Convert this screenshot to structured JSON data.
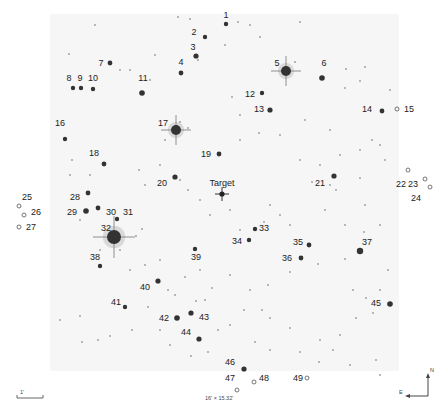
{
  "field_size_label": "16' × 15.32'",
  "scale_bar_label": "1'",
  "compass": {
    "north": "N",
    "east": "E"
  },
  "target": {
    "label": "Target",
    "x": 222,
    "y": 194
  },
  "colors": {
    "background": "#ffffff",
    "field": "#f6f6f6",
    "star": "#222222",
    "label": "#222222"
  },
  "comparison_stars": [
    {
      "id": "1",
      "x": 226,
      "y": 24,
      "lx": 226,
      "ly": 18,
      "r": 2.2,
      "off": false
    },
    {
      "id": "2",
      "x": 205,
      "y": 37,
      "lx": 194,
      "ly": 35,
      "r": 2.2,
      "off": false
    },
    {
      "id": "3",
      "x": 196,
      "y": 56,
      "lx": 193,
      "ly": 50,
      "r": 2.6,
      "off": false
    },
    {
      "id": "4",
      "x": 181,
      "y": 73,
      "lx": 181,
      "ly": 65,
      "r": 2.4,
      "off": false
    },
    {
      "id": "5",
      "x": 286,
      "y": 71,
      "lx": 277,
      "ly": 66,
      "r": 5,
      "off": false
    },
    {
      "id": "6",
      "x": 322,
      "y": 78,
      "lx": 324,
      "ly": 66,
      "r": 2.8,
      "off": false
    },
    {
      "id": "7",
      "x": 110,
      "y": 63,
      "lx": 101,
      "ly": 66,
      "r": 2.4,
      "off": false
    },
    {
      "id": "8",
      "x": 73,
      "y": 88,
      "lx": 69,
      "ly": 81,
      "r": 2.2,
      "off": false
    },
    {
      "id": "9",
      "x": 81,
      "y": 88,
      "lx": 80,
      "ly": 81,
      "r": 2.2,
      "off": false
    },
    {
      "id": "10",
      "x": 93,
      "y": 89,
      "lx": 93,
      "ly": 81,
      "r": 2.2,
      "off": false
    },
    {
      "id": "11",
      "x": 142,
      "y": 93,
      "lx": 143,
      "ly": 81,
      "r": 2.8,
      "off": false
    },
    {
      "id": "12",
      "x": 262,
      "y": 93,
      "lx": 250,
      "ly": 97,
      "r": 2.2,
      "off": false
    },
    {
      "id": "13",
      "x": 270,
      "y": 110,
      "lx": 259,
      "ly": 112,
      "r": 2.6,
      "off": false
    },
    {
      "id": "14",
      "x": 382,
      "y": 111,
      "lx": 367,
      "ly": 112,
      "r": 2.4,
      "off": false
    },
    {
      "id": "15",
      "x": 397,
      "y": 109,
      "lx": 409,
      "ly": 112,
      "r": 2,
      "off": true
    },
    {
      "id": "16",
      "x": 65,
      "y": 139,
      "lx": 60,
      "ly": 126,
      "r": 2.2,
      "off": false
    },
    {
      "id": "17",
      "x": 176,
      "y": 130,
      "lx": 163,
      "ly": 126,
      "r": 5,
      "off": false
    },
    {
      "id": "18",
      "x": 104,
      "y": 164,
      "lx": 94,
      "ly": 156,
      "r": 2.4,
      "off": false
    },
    {
      "id": "19",
      "x": 219,
      "y": 154,
      "lx": 206,
      "ly": 157,
      "r": 2.4,
      "off": false
    },
    {
      "id": "20",
      "x": 175,
      "y": 177,
      "lx": 162,
      "ly": 186,
      "r": 2.6,
      "off": false
    },
    {
      "id": "21",
      "x": 334,
      "y": 176,
      "lx": 320,
      "ly": 186,
      "r": 2.6,
      "off": false
    },
    {
      "id": "22",
      "x": 408,
      "y": 170,
      "lx": 401,
      "ly": 187,
      "r": 2,
      "off": true
    },
    {
      "id": "23",
      "x": 425,
      "y": 179,
      "lx": 413,
      "ly": 187,
      "r": 2,
      "off": true
    },
    {
      "id": "24",
      "x": 430,
      "y": 187,
      "lx": 416,
      "ly": 201,
      "r": 2,
      "off": true
    },
    {
      "id": "25",
      "x": 19,
      "y": 206,
      "lx": 27,
      "ly": 200,
      "r": 2,
      "off": true
    },
    {
      "id": "26",
      "x": 24,
      "y": 215,
      "lx": 36,
      "ly": 215,
      "r": 2,
      "off": true
    },
    {
      "id": "27",
      "x": 19,
      "y": 227,
      "lx": 31,
      "ly": 230,
      "r": 2,
      "off": true
    },
    {
      "id": "28",
      "x": 88,
      "y": 193,
      "lx": 75,
      "ly": 200,
      "r": 2.4,
      "off": false
    },
    {
      "id": "29",
      "x": 86,
      "y": 211,
      "lx": 72,
      "ly": 215,
      "r": 2.8,
      "off": false
    },
    {
      "id": "30",
      "x": 98,
      "y": 208,
      "lx": 111,
      "ly": 215,
      "r": 2.4,
      "off": false
    },
    {
      "id": "31",
      "x": 117,
      "y": 219,
      "lx": 128,
      "ly": 215,
      "r": 2.2,
      "off": false
    },
    {
      "id": "32",
      "x": 114,
      "y": 237,
      "lx": 106,
      "ly": 231,
      "r": 7,
      "off": false
    },
    {
      "id": "33",
      "x": 255,
      "y": 229,
      "lx": 264,
      "ly": 231,
      "r": 2.2,
      "off": false
    },
    {
      "id": "34",
      "x": 249,
      "y": 240,
      "lx": 237,
      "ly": 244,
      "r": 2.2,
      "off": false
    },
    {
      "id": "35",
      "x": 309,
      "y": 245,
      "lx": 298,
      "ly": 245,
      "r": 2.4,
      "off": false
    },
    {
      "id": "36",
      "x": 301,
      "y": 258,
      "lx": 287,
      "ly": 261,
      "r": 2.4,
      "off": false
    },
    {
      "id": "37",
      "x": 360,
      "y": 251,
      "lx": 367,
      "ly": 245,
      "r": 3.2,
      "off": false
    },
    {
      "id": "38",
      "x": 100,
      "y": 266,
      "lx": 95,
      "ly": 260,
      "r": 2.2,
      "off": false
    },
    {
      "id": "39",
      "x": 195,
      "y": 249,
      "lx": 196,
      "ly": 260,
      "r": 2.2,
      "off": false
    },
    {
      "id": "40",
      "x": 158,
      "y": 281,
      "lx": 145,
      "ly": 290,
      "r": 2.6,
      "off": false
    },
    {
      "id": "41",
      "x": 125,
      "y": 307,
      "lx": 116,
      "ly": 305,
      "r": 2.2,
      "off": false
    },
    {
      "id": "42",
      "x": 177,
      "y": 318,
      "lx": 164,
      "ly": 321,
      "r": 2.8,
      "off": false
    },
    {
      "id": "43",
      "x": 191,
      "y": 313,
      "lx": 204,
      "ly": 320,
      "r": 2.6,
      "off": false
    },
    {
      "id": "44",
      "x": 199,
      "y": 339,
      "lx": 186,
      "ly": 335,
      "r": 2.6,
      "off": false
    },
    {
      "id": "45",
      "x": 390,
      "y": 304,
      "lx": 376,
      "ly": 306,
      "r": 2.8,
      "off": false
    },
    {
      "id": "46",
      "x": 244,
      "y": 369,
      "lx": 230,
      "ly": 365,
      "r": 2.6,
      "off": false
    },
    {
      "id": "47",
      "x": 237,
      "y": 390,
      "lx": 230,
      "ly": 381,
      "r": 2,
      "off": true
    },
    {
      "id": "48",
      "x": 254,
      "y": 382,
      "lx": 264,
      "ly": 381,
      "r": 2,
      "off": true
    },
    {
      "id": "49",
      "x": 307,
      "y": 378,
      "lx": 298,
      "ly": 381,
      "r": 2,
      "off": true
    }
  ],
  "background_stars": [
    [
      178,
      17
    ],
    [
      190,
      19
    ],
    [
      95,
      25
    ],
    [
      69,
      54
    ],
    [
      198,
      60
    ],
    [
      155,
      55
    ],
    [
      120,
      70
    ],
    [
      130,
      70
    ],
    [
      150,
      80
    ],
    [
      225,
      45
    ],
    [
      295,
      62
    ],
    [
      250,
      25
    ],
    [
      238,
      22
    ],
    [
      300,
      22
    ],
    [
      260,
      37
    ],
    [
      346,
      69
    ],
    [
      365,
      67
    ],
    [
      360,
      81
    ],
    [
      345,
      88
    ],
    [
      232,
      97
    ],
    [
      240,
      115
    ],
    [
      259,
      133
    ],
    [
      280,
      135
    ],
    [
      305,
      120
    ],
    [
      330,
      130
    ],
    [
      372,
      140
    ],
    [
      390,
      90
    ],
    [
      180,
      122
    ],
    [
      188,
      128
    ],
    [
      165,
      140
    ],
    [
      240,
      140
    ],
    [
      300,
      160
    ],
    [
      320,
      165
    ],
    [
      340,
      155
    ],
    [
      360,
      150
    ],
    [
      380,
      145
    ],
    [
      330,
      185
    ],
    [
      312,
      182
    ],
    [
      336,
      190
    ],
    [
      360,
      178
    ],
    [
      385,
      160
    ],
    [
      72,
      160
    ],
    [
      70,
      175
    ],
    [
      90,
      175
    ],
    [
      139,
      170
    ],
    [
      145,
      185
    ],
    [
      160,
      165
    ],
    [
      180,
      180
    ],
    [
      188,
      190
    ],
    [
      200,
      200
    ],
    [
      210,
      215
    ],
    [
      230,
      210
    ],
    [
      240,
      230
    ],
    [
      264,
      222
    ],
    [
      270,
      205
    ],
    [
      280,
      215
    ],
    [
      290,
      225
    ],
    [
      325,
      210
    ],
    [
      345,
      225
    ],
    [
      365,
      205
    ],
    [
      380,
      225
    ],
    [
      80,
      220
    ],
    [
      142,
      229
    ],
    [
      136,
      236
    ],
    [
      100,
      250
    ],
    [
      120,
      250
    ],
    [
      130,
      270
    ],
    [
      145,
      265
    ],
    [
      160,
      260
    ],
    [
      175,
      295
    ],
    [
      200,
      270
    ],
    [
      212,
      288
    ],
    [
      230,
      275
    ],
    [
      250,
      290
    ],
    [
      268,
      285
    ],
    [
      290,
      272
    ],
    [
      318,
      264
    ],
    [
      345,
      259
    ],
    [
      364,
      232
    ],
    [
      388,
      270
    ],
    [
      380,
      290
    ],
    [
      353,
      290
    ],
    [
      366,
      298
    ],
    [
      373,
      313
    ],
    [
      356,
      318
    ],
    [
      340,
      335
    ],
    [
      333,
      350
    ],
    [
      319,
      362
    ],
    [
      300,
      352
    ],
    [
      290,
      328
    ],
    [
      270,
      318
    ],
    [
      262,
      310
    ],
    [
      244,
      310
    ],
    [
      230,
      325
    ],
    [
      218,
      330
    ],
    [
      205,
      300
    ],
    [
      196,
      301
    ],
    [
      185,
      277
    ],
    [
      168,
      290
    ],
    [
      148,
      307
    ],
    [
      132,
      330
    ],
    [
      110,
      336
    ],
    [
      98,
      340
    ],
    [
      82,
      342
    ],
    [
      60,
      320
    ],
    [
      80,
      316
    ],
    [
      160,
      330
    ],
    [
      170,
      345
    ],
    [
      191,
      356
    ],
    [
      208,
      352
    ],
    [
      255,
      342
    ],
    [
      270,
      350
    ],
    [
      350,
      365
    ],
    [
      376,
      360
    ],
    [
      380,
      375
    ],
    [
      320,
      340
    ]
  ]
}
